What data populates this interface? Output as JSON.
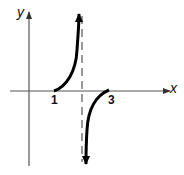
{
  "diagram": {
    "type": "function-graph",
    "axes": {
      "x_label": "x",
      "y_label": "y"
    },
    "tick_labels": {
      "one": "1",
      "three": "3"
    },
    "features": {
      "x_intercepts": [
        1,
        3
      ],
      "vertical_asymptote_between": [
        1,
        3
      ],
      "left_branch": "increasing from (1,0) toward +infinity at asymptote",
      "right_branch": "rising from -infinity at asymptote to (3,0)"
    },
    "colors": {
      "curve": "#000000",
      "axes": "#555555",
      "asymptote": "#555555"
    }
  }
}
